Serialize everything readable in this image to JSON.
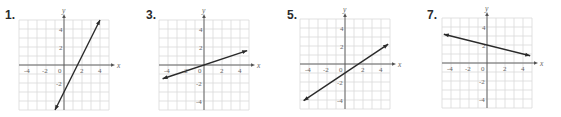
{
  "chart_data": [
    {
      "type": "line",
      "label": "1.",
      "title": "",
      "xlabel": "x",
      "ylabel": "y",
      "xlim": [
        -5,
        5
      ],
      "ylim": [
        -5,
        5
      ],
      "grid": true,
      "x_ticks": [
        "-4",
        "-2",
        "0",
        "2",
        "4"
      ],
      "y_ticks": [
        "4",
        "2",
        "-2"
      ],
      "series": [
        {
          "name": "line",
          "equation": "y = 2x - 3",
          "x": [
            -1,
            4
          ],
          "y": [
            -5,
            5
          ]
        }
      ],
      "origin_px": [
        64,
        65
      ],
      "unit_px": 9,
      "label_px": [
        5,
        20
      ]
    },
    {
      "type": "line",
      "label": "3.",
      "title": "",
      "xlabel": "x",
      "ylabel": "y",
      "xlim": [
        -5,
        5
      ],
      "ylim": [
        -5,
        5
      ],
      "grid": true,
      "x_ticks": [
        "-4",
        "-2",
        "0",
        "2",
        "4"
      ],
      "y_ticks": [
        "4",
        "2",
        "-2",
        "-4"
      ],
      "series": [
        {
          "name": "line",
          "equation": "y = x/3",
          "x": [
            -4.6,
            4.8
          ],
          "y": [
            -1.53,
            1.6
          ]
        }
      ],
      "origin_px": [
        204,
        65
      ],
      "unit_px": 9,
      "label_px": [
        146,
        20
      ]
    },
    {
      "type": "line",
      "label": "5.",
      "title": "",
      "xlabel": "x",
      "ylabel": "y",
      "xlim": [
        -5,
        5
      ],
      "ylim": [
        -5,
        5
      ],
      "grid": true,
      "x_ticks": [
        "-4",
        "-2",
        "0",
        "2",
        "4"
      ],
      "y_ticks": [
        "4",
        "2",
        "-2",
        "-4"
      ],
      "series": [
        {
          "name": "line",
          "equation": "y = (2/3)x - 1",
          "x": [
            -4.6,
            4.8
          ],
          "y": [
            -4.07,
            2.2
          ]
        }
      ],
      "origin_px": [
        345,
        64
      ],
      "unit_px": 9,
      "label_px": [
        287,
        20
      ]
    },
    {
      "type": "line",
      "label": "7.",
      "title": "",
      "xlabel": "x",
      "ylabel": "y",
      "xlim": [
        -5,
        5
      ],
      "ylim": [
        -5,
        5
      ],
      "grid": true,
      "x_ticks": [
        "-4",
        "-2",
        "0",
        "2",
        "4"
      ],
      "y_ticks": [
        "4",
        "2",
        "-2",
        "-4"
      ],
      "series": [
        {
          "name": "line",
          "equation": "y = -x/4 + 2",
          "x": [
            -4.8,
            4.8
          ],
          "y": [
            3.2,
            0.8
          ]
        }
      ],
      "origin_px": [
        487,
        63
      ],
      "unit_px": 9,
      "label_px": [
        427,
        20
      ]
    }
  ],
  "problems": [
    {
      "label": "1."
    },
    {
      "label": "3."
    },
    {
      "label": "5."
    },
    {
      "label": "7."
    }
  ]
}
